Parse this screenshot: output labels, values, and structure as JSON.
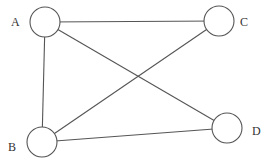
{
  "diagram": {
    "type": "undirected-graph",
    "nodes": [
      {
        "id": "A",
        "label": "A",
        "cx": 45,
        "cy": 22,
        "r": 15,
        "lx": 11,
        "ly": 26
      },
      {
        "id": "C",
        "label": "C",
        "cx": 219,
        "cy": 21,
        "r": 15,
        "lx": 240,
        "ly": 26
      },
      {
        "id": "B",
        "label": "B",
        "cx": 42,
        "cy": 142,
        "r": 15,
        "lx": 8,
        "ly": 151
      },
      {
        "id": "D",
        "label": "D",
        "cx": 227,
        "cy": 128,
        "r": 15,
        "lx": 252,
        "ly": 135
      }
    ],
    "edges": [
      {
        "from": "A",
        "to": "C"
      },
      {
        "from": "A",
        "to": "B"
      },
      {
        "from": "A",
        "to": "D"
      },
      {
        "from": "C",
        "to": "B"
      },
      {
        "from": "B",
        "to": "D"
      }
    ],
    "colors": {
      "stroke": "#555555",
      "text": "#333333",
      "background": "#ffffff"
    }
  }
}
